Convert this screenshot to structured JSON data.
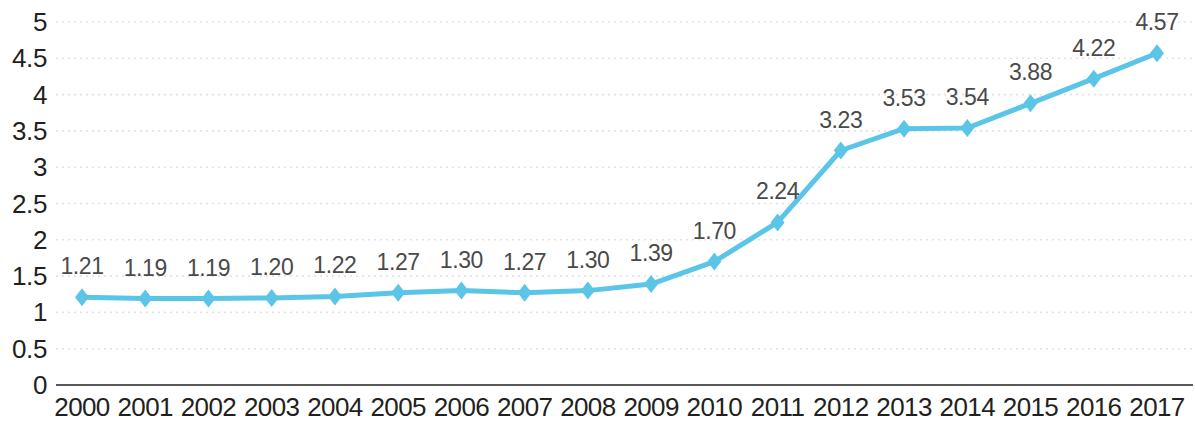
{
  "chart_data": {
    "type": "line",
    "title": "",
    "subtitle": "",
    "xlabel": "",
    "ylabel": "",
    "categories": [
      "2000",
      "2001",
      "2002",
      "2003",
      "2004",
      "2005",
      "2006",
      "2007",
      "2008",
      "2009",
      "2010",
      "2011",
      "2012",
      "2013",
      "2014",
      "2015",
      "2016",
      "2017"
    ],
    "values": [
      1.21,
      1.19,
      1.19,
      1.2,
      1.22,
      1.27,
      1.3,
      1.27,
      1.3,
      1.39,
      1.7,
      2.24,
      3.23,
      3.53,
      3.54,
      3.88,
      4.22,
      4.57
    ],
    "point_labels": [
      "1.21",
      "1.19",
      "1.19",
      "1.20",
      "1.22",
      "1.27",
      "1.30",
      "1.27",
      "1.30",
      "1.39",
      "1.70",
      "2.24",
      "3.23",
      "3.53",
      "3.54",
      "3.88",
      "4.22",
      "4.57"
    ],
    "ylim": [
      0,
      5
    ],
    "y_ticks": [
      0,
      0.5,
      1,
      1.5,
      2,
      2.5,
      3,
      3.5,
      4,
      4.5,
      5
    ],
    "y_tick_labels": [
      "0",
      "0.5",
      "1",
      "1.5",
      "2",
      "2.5",
      "3",
      "3.5",
      "4",
      "4.5",
      "5"
    ],
    "grid": true,
    "grid_style": "dotted",
    "legend": false,
    "legend_position": "none",
    "series": [
      {
        "name": "",
        "values": [
          1.21,
          1.19,
          1.19,
          1.2,
          1.22,
          1.27,
          1.3,
          1.27,
          1.3,
          1.39,
          1.7,
          2.24,
          3.23,
          3.53,
          3.54,
          3.88,
          4.22,
          4.57
        ]
      }
    ]
  },
  "style": {
    "line_color": "#5bc5e7",
    "marker_color": "#5bc5e7",
    "marker_shape": "diamond",
    "grid_color": "#e3e3e6",
    "axis_color": "#58585b",
    "tick_label_color": "#231f20",
    "point_label_color": "#4a4a4a",
    "background": "#ffffff"
  }
}
